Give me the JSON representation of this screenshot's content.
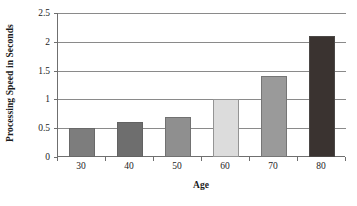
{
  "chart_data": {
    "type": "bar",
    "title": "",
    "subtitle": "",
    "xlabel": "Age",
    "ylabel": "Processing Speed in Seconds",
    "categories": [
      "30",
      "40",
      "50",
      "60",
      "70",
      "80"
    ],
    "values": [
      0.5,
      0.6,
      0.7,
      1.0,
      1.4,
      2.1
    ],
    "series": [
      {
        "name": "Processing Speed",
        "values": [
          0.5,
          0.6,
          0.7,
          1.0,
          1.4,
          2.1
        ]
      }
    ],
    "bar_colors": [
      "#7d7d7d",
      "#6e6e6e",
      "#8f8f8f",
      "#dcdcdc",
      "#9a9a9a",
      "#3a3330"
    ],
    "ylim": [
      0,
      2.5
    ],
    "ytick_values": [
      0,
      0.5,
      1,
      1.5,
      2,
      2.5
    ],
    "ytick_labels": [
      "0",
      "0.5",
      "1",
      "1.5",
      "2",
      "2.5"
    ],
    "grid": "horizontal",
    "gridline_color": "#8a8a8a",
    "axis_color": "#6f6f6f",
    "legend": "none",
    "legend_position": "",
    "background_color": "#ffffff",
    "annotations": []
  }
}
